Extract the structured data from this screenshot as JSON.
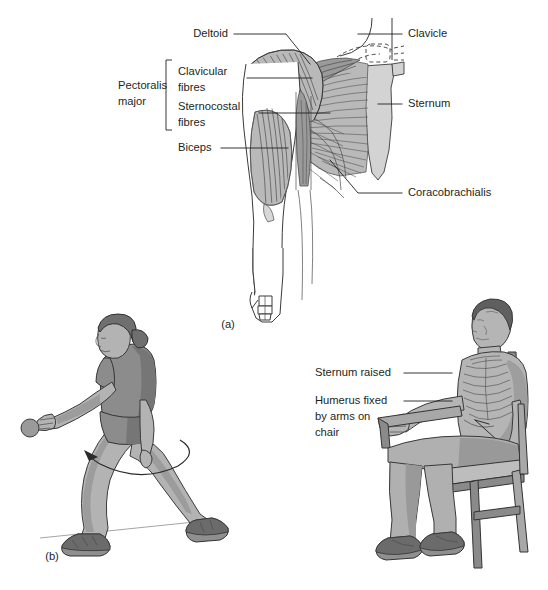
{
  "figure": {
    "background_color": "#ffffff",
    "ink_color": "#231f20",
    "panels": [
      {
        "id": "a",
        "label": "(a)",
        "x": 228,
        "y": 325
      },
      {
        "id": "b",
        "label": "(b)",
        "x": 52,
        "y": 557
      }
    ]
  },
  "panel_a": {
    "title_labels": [
      {
        "name": "deltoid",
        "text": "Deltoid",
        "text_x": 228,
        "text_y": 34,
        "anchor": "end",
        "leader": "M 234 34 L 286 34 L 310 64"
      },
      {
        "name": "clavicular-fibres",
        "text_line1": "Clavicular",
        "text_line2": "fibres",
        "text_x": 178,
        "text_y": 78,
        "anchor": "start",
        "leader": "M 247 78 L 312 78"
      },
      {
        "name": "sternocostal-fibres",
        "text_line1": "Sternocostal",
        "text_line2": "fibres",
        "text_x": 178,
        "text_y": 113,
        "anchor": "start",
        "leader": "M 259 113 L 330 113"
      },
      {
        "name": "biceps",
        "text": "Biceps",
        "text_x": 178,
        "text_y": 148,
        "anchor": "start",
        "leader": "M 221 148 L 288 148"
      },
      {
        "name": "pectoralis-major",
        "text_line1": "Pectoralis",
        "text_line2": "major",
        "text_x": 118,
        "text_y": 92,
        "anchor": "start",
        "bracket": "M 172 60 L 166 60 L 166 130 L 172 130"
      },
      {
        "name": "clavicle",
        "text": "Clavicle",
        "text_x": 408,
        "text_y": 34,
        "anchor": "start",
        "leader": "M 358 34 L 402 34"
      },
      {
        "name": "sternum",
        "text": "Sternum",
        "text_x": 408,
        "text_y": 104,
        "anchor": "start",
        "leader": "M 378 104 L 402 104"
      },
      {
        "name": "coracobrachialis",
        "text": "Coracobrachialis",
        "text_x": 408,
        "text_y": 193,
        "anchor": "start",
        "leader": "M 330 160 L 358 193 L 402 193"
      }
    ]
  },
  "panel_b": {
    "left_scene": {
      "name": "throwing-athlete",
      "description_visible": false
    },
    "right_scene": {
      "name": "seated-patient",
      "labels": [
        {
          "name": "sternum-raised",
          "text": "Sternum raised",
          "text_x": 315,
          "text_y": 373,
          "anchor": "start",
          "leader": "M 404 373 L 452 373"
        },
        {
          "name": "humerus-fixed",
          "text_line1": "Humerus fixed",
          "text_line2": "by arms on",
          "text_line3": "chair",
          "text_x": 315,
          "text_y": 401,
          "anchor": "start",
          "leader": "M 404 401 L 452 401 L 475 420"
        }
      ]
    }
  },
  "colors": {
    "muscle_mid": "#b9b9b9",
    "muscle_dark": "#9a9a9a",
    "bone": "#d3d3d3",
    "skin": "#b3b3b3",
    "shirt": "#8c8c8c",
    "hair": "#6f6f6f",
    "chair": "#a8a8a8",
    "ink": "#231f20"
  }
}
